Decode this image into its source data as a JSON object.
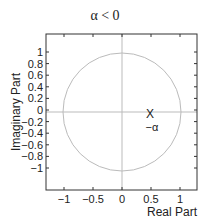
{
  "chart_data": {
    "type": "scatter",
    "title": "α < 0",
    "xlabel": "Real Part",
    "ylabel": "Imaginary Part",
    "xlim": [
      -1.3,
      1.3
    ],
    "ylim": [
      -1.3,
      1.3
    ],
    "xticks": [
      "−1",
      "−0.5",
      "0",
      "0.5",
      "1"
    ],
    "yticks": [
      "1",
      "0.8",
      "0.6",
      "0.4",
      "0.2",
      "0",
      "−0.2",
      "−0.4",
      "−0.6",
      "−0.8",
      "−1"
    ],
    "grid": false,
    "unit_circle": {
      "center": [
        0,
        0
      ],
      "radius": 1
    },
    "poles": [
      {
        "x": 0.5,
        "y": 0,
        "marker": "X"
      }
    ],
    "annotations": [
      {
        "text": "−α",
        "x": 0.5,
        "y": -0.2
      }
    ]
  },
  "colors": {
    "axis": "#333333",
    "circle": "#bbbbbb",
    "crosshair": "#bbbbbb"
  }
}
